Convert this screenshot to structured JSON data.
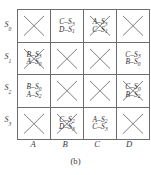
{
  "figure": {
    "caption": "(b)",
    "row_header_title": "",
    "col_header_title": "",
    "row_labels": [
      {
        "base": "S",
        "sub": "0",
        "name": "s0"
      },
      {
        "base": "S",
        "sub": "1",
        "name": "s1"
      },
      {
        "base": "S",
        "sub": "2",
        "name": "s2"
      },
      {
        "base": "S",
        "sub": "3",
        "name": "s3"
      }
    ],
    "col_labels": [
      "A",
      "B",
      "C",
      "D"
    ],
    "colors": {
      "border": "#6d6d6d",
      "x_stroke": "#7d7d7d",
      "text": "#3a3a3a",
      "background": "#ffffff"
    },
    "cells": [
      {
        "row": "S0",
        "col": "A",
        "crossed": true,
        "entries": []
      },
      {
        "row": "S0",
        "col": "B",
        "crossed": false,
        "entries": [
          {
            "input": "C",
            "dash": "–",
            "state": "S",
            "sub": "3"
          },
          {
            "input": "D",
            "dash": "–",
            "state": "S",
            "sub": "1"
          }
        ]
      },
      {
        "row": "S0",
        "col": "C",
        "crossed": true,
        "entries": [
          {
            "input": "A",
            "dash": "–",
            "state": "S",
            "sub": "3"
          },
          {
            "input": "C",
            "dash": "–",
            "state": "S",
            "sub": "1"
          }
        ]
      },
      {
        "row": "S0",
        "col": "D",
        "crossed": true,
        "entries": []
      },
      {
        "row": "S1",
        "col": "A",
        "crossed": true,
        "entries": [
          {
            "input": "B",
            "dash": "–",
            "state": "S",
            "sub": "3"
          },
          {
            "input": "A",
            "dash": "–",
            "state": "S",
            "sub": "0"
          }
        ]
      },
      {
        "row": "S1",
        "col": "B",
        "crossed": true,
        "entries": []
      },
      {
        "row": "S1",
        "col": "C",
        "crossed": true,
        "entries": []
      },
      {
        "row": "S1",
        "col": "D",
        "crossed": false,
        "entries": [
          {
            "input": "C",
            "dash": "–",
            "state": "S",
            "sub": "3"
          },
          {
            "input": "B",
            "dash": "–",
            "state": "S",
            "sub": "0"
          }
        ]
      },
      {
        "row": "S2",
        "col": "A",
        "crossed": false,
        "entries": [
          {
            "input": "B",
            "dash": "–",
            "state": "S",
            "sub": "0"
          },
          {
            "input": "A",
            "dash": "–",
            "state": "S",
            "sub": "2"
          }
        ]
      },
      {
        "row": "S2",
        "col": "B",
        "crossed": true,
        "entries": []
      },
      {
        "row": "S2",
        "col": "C",
        "crossed": true,
        "entries": []
      },
      {
        "row": "S2",
        "col": "D",
        "crossed": true,
        "entries": [
          {
            "input": "C",
            "dash": "–",
            "state": "S",
            "sub": "0"
          },
          {
            "input": "B",
            "dash": "–",
            "state": "S",
            "sub": "2"
          }
        ]
      },
      {
        "row": "S3",
        "col": "A",
        "crossed": true,
        "entries": []
      },
      {
        "row": "S3",
        "col": "B",
        "crossed": true,
        "entries": [
          {
            "input": "C",
            "dash": "–",
            "state": "S",
            "sub": "2"
          },
          {
            "input": "D",
            "dash": "–",
            "state": "S",
            "sub": "3"
          }
        ]
      },
      {
        "row": "S3",
        "col": "C",
        "crossed": false,
        "entries": [
          {
            "input": "A",
            "dash": "–",
            "state": "S",
            "sub": "2"
          },
          {
            "input": "C",
            "dash": "–",
            "state": "S",
            "sub": "3"
          }
        ]
      },
      {
        "row": "S3",
        "col": "D",
        "crossed": true,
        "entries": []
      }
    ]
  }
}
